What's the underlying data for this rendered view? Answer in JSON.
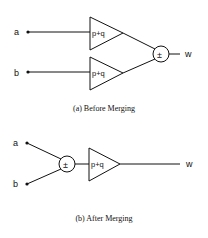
{
  "figure_a": {
    "caption": "(a) Before Merging",
    "inputs": [
      "a",
      "b"
    ],
    "amplifier_label": "p+q",
    "combiner_symbol": "±",
    "output": "w"
  },
  "figure_b": {
    "caption": "(b) After Merging",
    "inputs": [
      "a",
      "b"
    ],
    "amplifier_label": "p+q",
    "combiner_symbol": "±",
    "output": "w"
  }
}
